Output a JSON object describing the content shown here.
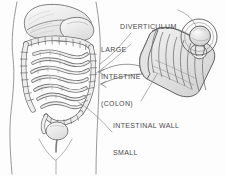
{
  "figure": {
    "type": "medical-illustration",
    "background_color": "#fdfdfd",
    "ink_color": "#4a4a4a",
    "shading_color": "#d8d8d8"
  },
  "labels": {
    "diverticulum": {
      "name": "diverticulum",
      "lines": [
        "DIVERTICULUM"
      ]
    },
    "large_intestine": {
      "name": "large-intestine-colon",
      "lines": [
        "LARGE",
        "INTESTINE",
        "(COLON)"
      ]
    },
    "intestinal_wall": {
      "name": "intestinal-wall",
      "lines": [
        "INTESTINAL WALL"
      ]
    },
    "small_intestine": {
      "name": "small-intestine",
      "lines": [
        "SMALL",
        "INTESTINE"
      ]
    }
  },
  "anatomy_parts": [
    "torso-outline",
    "liver",
    "stomach",
    "transverse-colon",
    "ascending-colon",
    "descending-colon",
    "sigmoid-colon",
    "small-intestine-coils",
    "bladder",
    "cutaway-intestine-segment",
    "diverticulum-pouch"
  ]
}
